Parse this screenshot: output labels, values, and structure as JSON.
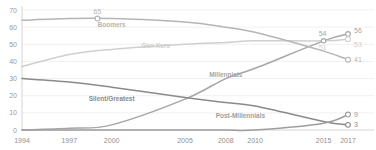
{
  "chart_data": {
    "type": "line",
    "title": "",
    "subtitle": "",
    "xlabel": "",
    "ylabel": "",
    "xlim": [
      1994,
      2017
    ],
    "ylim": [
      0,
      70
    ],
    "grid": true,
    "legend_position": "inline-labels",
    "x_tick_labels": [
      "1994",
      "1997",
      "2000",
      "2005",
      "2008",
      "2010",
      "2015",
      "2017"
    ],
    "x_ticks": [
      1994,
      1997,
      2000,
      2005,
      2008,
      2010,
      2015,
      2017
    ],
    "y_tick_labels": [
      "0",
      "10",
      "20",
      "30",
      "40",
      "50",
      "60",
      "70"
    ],
    "y_ticks": [
      0,
      10,
      20,
      30,
      40,
      50,
      60,
      70
    ],
    "series": [
      {
        "name": "Millennials",
        "color": "#a6a6a6",
        "label_x": 2008,
        "label_y": 31,
        "end_label": "56",
        "x": [
          1994,
          1997,
          2000,
          2005,
          2008,
          2010,
          2015,
          2017
        ],
        "values": [
          0,
          1,
          3,
          18,
          30,
          36,
          52,
          56
        ]
      },
      {
        "name": "Gen Xers",
        "color": "#cfcfcf",
        "label_x": 2003,
        "label_y": 48,
        "end_label": "53",
        "x": [
          1994,
          1997,
          2000,
          2005,
          2008,
          2010,
          2015,
          2017
        ],
        "values": [
          37,
          44,
          47,
          50,
          51,
          52,
          52,
          53
        ]
      },
      {
        "name": "Boomers",
        "color": "#b5b5b5",
        "label_x": 2000,
        "label_y": 60,
        "peak_label": "65",
        "peak_x": 1999,
        "peak_y": 65,
        "end_label": "41",
        "x": [
          1994,
          1997,
          2000,
          2005,
          2008,
          2010,
          2015,
          2017
        ],
        "values": [
          64,
          65,
          65,
          63,
          60,
          57,
          46,
          41
        ]
      },
      {
        "name": "Silent/Greatest",
        "color": "#8a8a8a",
        "label_x": 2000,
        "label_y": 17,
        "end_label": "3",
        "x": [
          1994,
          1997,
          2000,
          2005,
          2008,
          2010,
          2015,
          2017
        ],
        "values": [
          30,
          28,
          25,
          19,
          16,
          14,
          5,
          3
        ]
      },
      {
        "name": "Post-Millennials",
        "color": "#9e9e9e",
        "label_x": 2009,
        "label_y": 7,
        "end_label": "9",
        "x": [
          1994,
          1997,
          2000,
          2005,
          2008,
          2010,
          2015,
          2017
        ],
        "values": [
          0,
          0,
          0,
          0,
          0,
          0,
          4,
          9
        ]
      }
    ],
    "inline_annotations": [
      {
        "text": "65",
        "series": "Boomers",
        "kind": "peak-callout"
      },
      {
        "text": "54",
        "series": "Millennials",
        "kind": "near-end-callout"
      },
      {
        "text": "56",
        "series": "Millennials",
        "kind": "end"
      },
      {
        "text": "53",
        "series": "Gen Xers",
        "kind": "end"
      },
      {
        "text": "51",
        "series": "Gen Xers",
        "kind": "near-end-callout"
      },
      {
        "text": "41",
        "series": "Boomers",
        "kind": "end"
      },
      {
        "text": "9",
        "series": "Post-Millennials",
        "kind": "end"
      },
      {
        "text": "3",
        "series": "Silent/Greatest",
        "kind": "end"
      }
    ]
  },
  "colors": {
    "grid": "#e9e9e9",
    "axis": "#c9c9c9",
    "tick_text": "#9a9a9a"
  }
}
